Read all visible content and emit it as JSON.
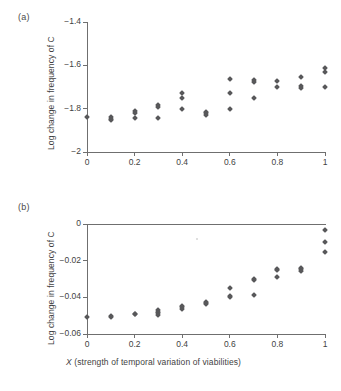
{
  "figure": {
    "panel_a_label": "(a)",
    "panel_b_label": "(b)"
  },
  "chart_data": [
    {
      "type": "scatter",
      "panel": "(a)",
      "title": "",
      "xlabel": "",
      "ylabel": "Log change in frequency of C",
      "xlim": [
        0,
        1
      ],
      "ylim": [
        -2,
        -1.4
      ],
      "xticks": [
        0,
        0.2,
        0.4,
        0.6,
        0.8,
        1
      ],
      "xticklabels": [
        "0",
        "0.2",
        "0.4",
        "0.6",
        "0.8",
        "1"
      ],
      "yticks": [
        -1.4,
        -1.6,
        -1.8,
        -2
      ],
      "yticklabels": [
        "−1.4",
        "−1.6",
        "−1.8",
        "−2"
      ],
      "grid": false,
      "legend": null,
      "marker": "diamond",
      "marker_color": "#58585a",
      "points": [
        {
          "x": 0.0,
          "y": -1.838
        },
        {
          "x": 0.1,
          "y": -1.84
        },
        {
          "x": 0.1,
          "y": -1.846
        },
        {
          "x": 0.1,
          "y": -1.851
        },
        {
          "x": 0.2,
          "y": -1.812
        },
        {
          "x": 0.2,
          "y": -1.82
        },
        {
          "x": 0.2,
          "y": -1.845
        },
        {
          "x": 0.3,
          "y": -1.782
        },
        {
          "x": 0.3,
          "y": -1.793
        },
        {
          "x": 0.3,
          "y": -1.845
        },
        {
          "x": 0.4,
          "y": -1.726
        },
        {
          "x": 0.4,
          "y": -1.752
        },
        {
          "x": 0.4,
          "y": -1.8
        },
        {
          "x": 0.5,
          "y": -1.814
        },
        {
          "x": 0.5,
          "y": -1.822
        },
        {
          "x": 0.5,
          "y": -1.83
        },
        {
          "x": 0.6,
          "y": -1.664
        },
        {
          "x": 0.6,
          "y": -1.726
        },
        {
          "x": 0.6,
          "y": -1.8
        },
        {
          "x": 0.7,
          "y": -1.668
        },
        {
          "x": 0.7,
          "y": -1.678
        },
        {
          "x": 0.7,
          "y": -1.752
        },
        {
          "x": 0.8,
          "y": -1.672
        },
        {
          "x": 0.8,
          "y": -1.7
        },
        {
          "x": 0.9,
          "y": -1.652
        },
        {
          "x": 0.9,
          "y": -1.696
        },
        {
          "x": 0.9,
          "y": -1.704
        },
        {
          "x": 1.0,
          "y": -1.614
        },
        {
          "x": 1.0,
          "y": -1.63
        },
        {
          "x": 1.0,
          "y": -1.7
        }
      ]
    },
    {
      "type": "scatter",
      "panel": "(b)",
      "title": "",
      "xlabel": "X (strength of temporal variation of viabilities)",
      "xlabel_italic_prefix": "X",
      "xlabel_rest": " (strength of temporal variation of viabilities)",
      "ylabel": "Log change in frequency of C",
      "xlim": [
        0,
        1
      ],
      "ylim": [
        -0.06,
        0
      ],
      "xticks": [
        0,
        0.2,
        0.4,
        0.6,
        0.8,
        1
      ],
      "xticklabels": [
        "0",
        "0.2",
        "0.4",
        "0.6",
        "0.8",
        "1"
      ],
      "yticks": [
        0,
        -0.02,
        -0.04,
        -0.06
      ],
      "yticklabels": [
        "0",
        "−0.02",
        "−0.04",
        "−0.06"
      ],
      "grid": false,
      "legend": null,
      "marker": "diamond",
      "marker_color": "#58585a",
      "points": [
        {
          "x": 0.0,
          "y": -0.0505
        },
        {
          "x": 0.1,
          "y": -0.0503
        },
        {
          "x": 0.1,
          "y": -0.0507
        },
        {
          "x": 0.2,
          "y": -0.0489
        },
        {
          "x": 0.2,
          "y": -0.0493
        },
        {
          "x": 0.3,
          "y": -0.047
        },
        {
          "x": 0.3,
          "y": -0.0478
        },
        {
          "x": 0.3,
          "y": -0.0487
        },
        {
          "x": 0.3,
          "y": -0.0497
        },
        {
          "x": 0.4,
          "y": -0.0448
        },
        {
          "x": 0.4,
          "y": -0.0455
        },
        {
          "x": 0.4,
          "y": -0.0462
        },
        {
          "x": 0.5,
          "y": -0.0425
        },
        {
          "x": 0.5,
          "y": -0.0432
        },
        {
          "x": 0.5,
          "y": -0.0438
        },
        {
          "x": 0.6,
          "y": -0.035
        },
        {
          "x": 0.6,
          "y": -0.0392
        },
        {
          "x": 0.6,
          "y": -0.04
        },
        {
          "x": 0.7,
          "y": -0.0298
        },
        {
          "x": 0.7,
          "y": -0.0308
        },
        {
          "x": 0.7,
          "y": -0.0386
        },
        {
          "x": 0.8,
          "y": -0.0243
        },
        {
          "x": 0.8,
          "y": -0.0252
        },
        {
          "x": 0.8,
          "y": -0.0288
        },
        {
          "x": 0.9,
          "y": -0.0238
        },
        {
          "x": 0.9,
          "y": -0.0247
        },
        {
          "x": 0.9,
          "y": -0.0257
        },
        {
          "x": 1.0,
          "y": -0.0033
        },
        {
          "x": 1.0,
          "y": -0.01
        },
        {
          "x": 1.0,
          "y": -0.0155
        }
      ]
    }
  ]
}
